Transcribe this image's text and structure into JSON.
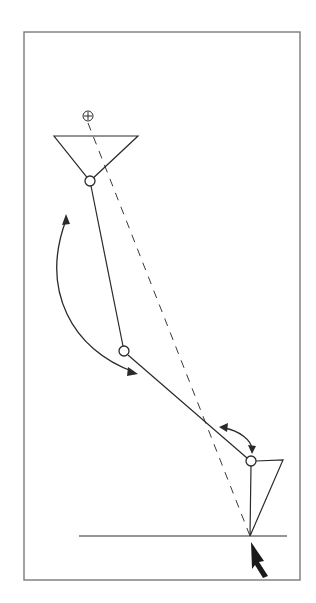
{
  "diagram": {
    "title": "",
    "colors": {
      "background": "#ffffff",
      "frame": "#7a7a7a",
      "ink": "#2a2a2a"
    },
    "frame": {
      "x": 24,
      "y": 32,
      "width": 276,
      "height": 548
    },
    "center_of_mass_marker": {
      "symbol": "⊕",
      "x": 88,
      "y": 116,
      "r": 5
    },
    "top_triangle": {
      "points": [
        [
          54,
          136
        ],
        [
          138,
          136
        ],
        [
          90,
          181
        ]
      ]
    },
    "joints": [
      {
        "name": "upper-joint",
        "x": 90,
        "y": 181,
        "r": 5
      },
      {
        "name": "middle-joint",
        "x": 124,
        "y": 351,
        "r": 5
      },
      {
        "name": "lower-joint",
        "x": 251,
        "y": 461,
        "r": 5
      }
    ],
    "segments": [
      {
        "name": "upper-segment",
        "from": [
          91,
          186
        ],
        "to": [
          123,
          346
        ]
      },
      {
        "name": "lower-segment",
        "from": [
          128,
          355
        ],
        "to": [
          247,
          458
        ]
      }
    ],
    "foot_triangle": {
      "points": [
        [
          256,
          461
        ],
        [
          283,
          460
        ],
        [
          250,
          536
        ],
        [
          251,
          466
        ]
      ]
    },
    "ground_line": {
      "x1": 79,
      "x2": 287,
      "y": 536
    },
    "line_of_action": {
      "from": [
        88,
        123
      ],
      "to": [
        250,
        536
      ],
      "style": "dashed"
    },
    "rotation_arrows": [
      {
        "name": "large-rotation-arrow",
        "path": "M 66 218 C 40 290, 70 350, 136 373",
        "heads": "both"
      },
      {
        "name": "small-rotation-arrow",
        "path": "M 221 428 C 240 431, 252 440, 252 451",
        "heads": "both"
      }
    ],
    "force_pointer": {
      "tip": [
        251,
        543
      ],
      "direction": "up-left"
    }
  }
}
